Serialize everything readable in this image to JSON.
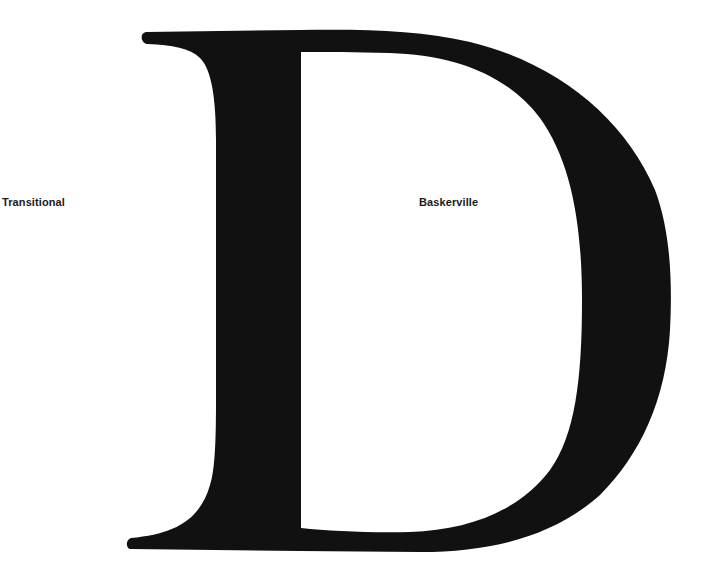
{
  "specimen": {
    "letter": "D",
    "classification_label": "Transitional",
    "typeface_label": "Baskerville",
    "glyph_color": "#111111",
    "background_color": "#ffffff"
  }
}
